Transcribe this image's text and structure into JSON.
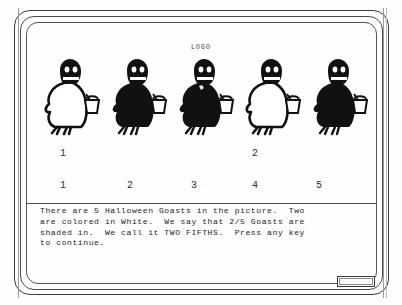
{
  "screen": {
    "logo": "LOGO",
    "title": "Halloween Goasts Fractions Lesson"
  },
  "picture": {
    "figures": [
      {
        "index": 1,
        "label": "goast-figure-1",
        "shaded": false,
        "shaded_count_label": "1"
      },
      {
        "index": 2,
        "label": "goast-figure-2",
        "shaded": true,
        "shaded_count_label": ""
      },
      {
        "index": 3,
        "label": "goast-figure-3",
        "shaded": true,
        "shaded_count_label": ""
      },
      {
        "index": 4,
        "label": "goast-figure-4",
        "shaded": false,
        "shaded_count_label": "2"
      },
      {
        "index": 5,
        "label": "goast-figure-5",
        "shaded": true,
        "shaded_count_label": ""
      }
    ]
  },
  "counts": {
    "white_row": [
      "1",
      "",
      "",
      "2",
      ""
    ],
    "total_row": [
      "1",
      "2",
      "3",
      "4",
      "5"
    ]
  },
  "message": {
    "lines": [
      "There are 5 Halloween Goasts in the picture.  Two",
      "are colored in White.  We say that 2/5 Goasts are",
      "shaded in.  We call it TWO FIFTHS.  Press any key",
      "to continue."
    ],
    "text": "There are 5 Halloween Goasts in the picture.  Two\nare colored in White.  We say that 2/5 Goasts are\nshaded in.  We call it TWO FIFTHS.  Press any key\nto continue."
  },
  "keybox": {
    "label": ""
  },
  "colors": {
    "ink": "#1d1d1d",
    "paper": "#fefefe",
    "frame": "#3b3b3b",
    "rail": "#9a9a9a"
  }
}
